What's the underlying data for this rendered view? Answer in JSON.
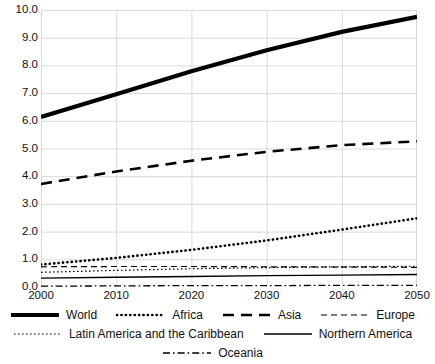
{
  "chart_data": {
    "type": "line",
    "title": "",
    "xlabel": "",
    "ylabel": "",
    "xlim": [
      2000,
      2050
    ],
    "ylim": [
      0.0,
      10.0
    ],
    "grid": true,
    "legend_position": "bottom",
    "x": [
      2000,
      2010,
      2020,
      2030,
      2040,
      2050
    ],
    "xtick_labels": [
      "2000",
      "2010",
      "2020",
      "2030",
      "2040",
      "2050"
    ],
    "ytick_labels": [
      "0.0",
      "1.0",
      "2.0",
      "3.0",
      "4.0",
      "5.0",
      "6.0",
      "7.0",
      "8.0",
      "9.0",
      "10.0"
    ],
    "ytick_values": [
      0.0,
      1.0,
      2.0,
      3.0,
      4.0,
      5.0,
      6.0,
      7.0,
      8.0,
      9.0,
      10.0
    ],
    "series": [
      {
        "name": "World",
        "style": "solid-thick",
        "color": "#000000",
        "width": 4.2,
        "dash": "",
        "values": [
          6.14,
          6.96,
          7.79,
          8.55,
          9.21,
          9.75
        ]
      },
      {
        "name": "Africa",
        "style": "dotted",
        "color": "#000000",
        "width": 2.6,
        "dash": "0.2,4.2",
        "values": [
          0.81,
          1.05,
          1.34,
          1.68,
          2.07,
          2.48
        ]
      },
      {
        "name": "Asia",
        "style": "dashed-long",
        "color": "#000000",
        "width": 2.6,
        "dash": "11,7",
        "values": [
          3.72,
          4.17,
          4.56,
          4.88,
          5.12,
          5.26
        ]
      },
      {
        "name": "Europe",
        "style": "dashed-medium",
        "color": "#000000",
        "width": 1.2,
        "dash": "6,4",
        "values": [
          0.73,
          0.74,
          0.74,
          0.73,
          0.72,
          0.71
        ]
      },
      {
        "name": "Latin America and the Caribbean",
        "style": "dotted-fine",
        "color": "#000000",
        "width": 1.2,
        "dash": "1.6,2.4",
        "values": [
          0.53,
          0.6,
          0.66,
          0.7,
          0.73,
          0.75
        ]
      },
      {
        "name": "Northern America",
        "style": "solid-thin",
        "color": "#000000",
        "width": 1.4,
        "dash": "",
        "values": [
          0.32,
          0.35,
          0.38,
          0.41,
          0.43,
          0.45
        ]
      },
      {
        "name": "Oceania",
        "style": "dash-dot",
        "color": "#000000",
        "width": 1.3,
        "dash": "7,3,1.6,3",
        "values": [
          0.03,
          0.04,
          0.05,
          0.05,
          0.06,
          0.06
        ]
      }
    ],
    "legend_rows": [
      [
        "World",
        "Africa",
        "Asia",
        "Europe"
      ],
      [
        "Latin America and the Caribbean",
        "Northern America"
      ],
      [
        "Oceania"
      ]
    ],
    "colors": {
      "grid": "#d9d9d9",
      "axis": "#b0b0b0",
      "line": "#000000",
      "background": "#ffffff",
      "text": "#111111"
    }
  }
}
